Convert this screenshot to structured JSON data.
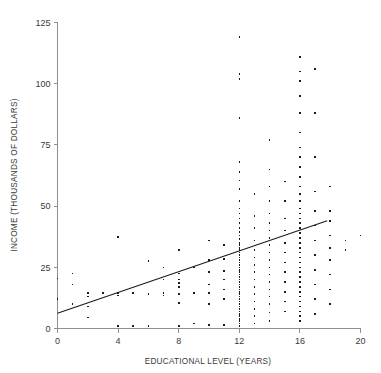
{
  "chart_data": {
    "type": "scatter",
    "title": "",
    "xlabel": "EDUCATIONAL LEVEL (YEARS)",
    "ylabel": "INCOME (THOUSANDS OF DOLLARS)",
    "xlim": [
      0,
      20
    ],
    "ylim": [
      0,
      125
    ],
    "xticks": [
      0,
      4,
      8,
      12,
      16,
      20
    ],
    "yticks": [
      0,
      25,
      50,
      75,
      100,
      125
    ],
    "xticklabels": [
      "0",
      "4",
      "8",
      "12",
      "16",
      "20"
    ],
    "yticklabels": [
      "0",
      "25",
      "50",
      "75",
      "100",
      "125"
    ],
    "grid": false,
    "legend": null,
    "marker": "square",
    "marker_color": "#1c1c1c",
    "marker_size_px": 1.6,
    "trendline": {
      "label": "least-squares regression line",
      "color": "#1a1a1a",
      "x_start": 0,
      "y_start": 6.2,
      "x_end": 17.8,
      "y_end": 44.0,
      "slope": 2.12,
      "intercept": 6.2
    },
    "points": [
      [
        0,
        20.5
      ],
      [
        0,
        12.0
      ],
      [
        1,
        22.5
      ],
      [
        1,
        18.0
      ],
      [
        1,
        10.0
      ],
      [
        2,
        14.5
      ],
      [
        2,
        9.0
      ],
      [
        2,
        4.5
      ],
      [
        2,
        13.0
      ],
      [
        3,
        14.5
      ],
      [
        4,
        37.5
      ],
      [
        4,
        14.5
      ],
      [
        4,
        13.5
      ],
      [
        4,
        1.0
      ],
      [
        5,
        14.5
      ],
      [
        5,
        1.0
      ],
      [
        6,
        27.5
      ],
      [
        6,
        14.0
      ],
      [
        6,
        1.0
      ],
      [
        7,
        25.0
      ],
      [
        7,
        20.0
      ],
      [
        7,
        14.5
      ],
      [
        7,
        13.5
      ],
      [
        8,
        32.0
      ],
      [
        8,
        22.5
      ],
      [
        8,
        20.0
      ],
      [
        8,
        18.5
      ],
      [
        8,
        17.0
      ],
      [
        8,
        14.0
      ],
      [
        8,
        10.5
      ],
      [
        8,
        1.0
      ],
      [
        9,
        25.0
      ],
      [
        9,
        14.5
      ],
      [
        9,
        2.0
      ],
      [
        10,
        36.0
      ],
      [
        10,
        28.0
      ],
      [
        10,
        23.0
      ],
      [
        10,
        18.0
      ],
      [
        10,
        14.5
      ],
      [
        10,
        10.0
      ],
      [
        10,
        1.5
      ],
      [
        11,
        34.0
      ],
      [
        11,
        28.5
      ],
      [
        11,
        23.5
      ],
      [
        11,
        20.0
      ],
      [
        11,
        16.0
      ],
      [
        11,
        12.0
      ],
      [
        11,
        1.5
      ],
      [
        12,
        119.0
      ],
      [
        12,
        104.0
      ],
      [
        12,
        102.0
      ],
      [
        12,
        86.0
      ],
      [
        12,
        68.0
      ],
      [
        12,
        64.0
      ],
      [
        12,
        60.5
      ],
      [
        12,
        57.0
      ],
      [
        12,
        52.0
      ],
      [
        12,
        49.0
      ],
      [
        12,
        47.0
      ],
      [
        12,
        45.0
      ],
      [
        12,
        43.0
      ],
      [
        12,
        41.0
      ],
      [
        12,
        39.5
      ],
      [
        12,
        38.0
      ],
      [
        12,
        36.5
      ],
      [
        12,
        35.0
      ],
      [
        12,
        34.0
      ],
      [
        12,
        33.0
      ],
      [
        12,
        32.0
      ],
      [
        12,
        31.0
      ],
      [
        12,
        30.0
      ],
      [
        12,
        29.0
      ],
      [
        12,
        28.0
      ],
      [
        12,
        27.0
      ],
      [
        12,
        26.0
      ],
      [
        12,
        25.0
      ],
      [
        12,
        24.0
      ],
      [
        12,
        23.0
      ],
      [
        12,
        22.0
      ],
      [
        12,
        21.0
      ],
      [
        12,
        20.0
      ],
      [
        12,
        19.0
      ],
      [
        12,
        18.0
      ],
      [
        12,
        17.0
      ],
      [
        12,
        16.0
      ],
      [
        12,
        15.0
      ],
      [
        12,
        14.0
      ],
      [
        12,
        13.0
      ],
      [
        12,
        12.0
      ],
      [
        12,
        11.0
      ],
      [
        12,
        10.0
      ],
      [
        12,
        9.0
      ],
      [
        12,
        8.0
      ],
      [
        12,
        7.0
      ],
      [
        12,
        6.0
      ],
      [
        12,
        5.0
      ],
      [
        12,
        4.0
      ],
      [
        12,
        3.0
      ],
      [
        12,
        2.0
      ],
      [
        12,
        1.0
      ],
      [
        13,
        55.0
      ],
      [
        13,
        46.0
      ],
      [
        13,
        41.0
      ],
      [
        13,
        36.0
      ],
      [
        13,
        32.0
      ],
      [
        13,
        29.0
      ],
      [
        13,
        26.0
      ],
      [
        13,
        23.0
      ],
      [
        13,
        20.0
      ],
      [
        13,
        17.0
      ],
      [
        13,
        14.0
      ],
      [
        13,
        11.0
      ],
      [
        13,
        8.0
      ],
      [
        13,
        5.0
      ],
      [
        13,
        2.0
      ],
      [
        14,
        77.0
      ],
      [
        14,
        65.0
      ],
      [
        14,
        58.0
      ],
      [
        14,
        52.0
      ],
      [
        14,
        47.0
      ],
      [
        14,
        43.0
      ],
      [
        14,
        40.0
      ],
      [
        14,
        37.0
      ],
      [
        14,
        34.0
      ],
      [
        14,
        31.0
      ],
      [
        14,
        28.0
      ],
      [
        14,
        25.0
      ],
      [
        14,
        22.0
      ],
      [
        14,
        19.0
      ],
      [
        14,
        16.0
      ],
      [
        14,
        13.0
      ],
      [
        14,
        10.0
      ],
      [
        14,
        6.5
      ],
      [
        14,
        3.0
      ],
      [
        15,
        60.0
      ],
      [
        15,
        52.0
      ],
      [
        15,
        45.0
      ],
      [
        15,
        40.0
      ],
      [
        15,
        35.0
      ],
      [
        15,
        31.0
      ],
      [
        15,
        27.0
      ],
      [
        15,
        23.0
      ],
      [
        15,
        19.0
      ],
      [
        15,
        15.0
      ],
      [
        15,
        11.0
      ],
      [
        15,
        7.0
      ],
      [
        16,
        111.0
      ],
      [
        16,
        105.0
      ],
      [
        16,
        101.0
      ],
      [
        16,
        95.0
      ],
      [
        16,
        88.0
      ],
      [
        16,
        80.0
      ],
      [
        16,
        74.0
      ],
      [
        16,
        70.0
      ],
      [
        16,
        66.0
      ],
      [
        16,
        62.0
      ],
      [
        16,
        58.0
      ],
      [
        16,
        55.0
      ],
      [
        16,
        52.0
      ],
      [
        16,
        49.0
      ],
      [
        16,
        47.0
      ],
      [
        16,
        45.0
      ],
      [
        16,
        43.0
      ],
      [
        16,
        41.0
      ],
      [
        16,
        39.0
      ],
      [
        16,
        37.0
      ],
      [
        16,
        35.0
      ],
      [
        16,
        33.0
      ],
      [
        16,
        31.0
      ],
      [
        16,
        29.0
      ],
      [
        16,
        27.0
      ],
      [
        16,
        25.0
      ],
      [
        16,
        23.0
      ],
      [
        16,
        21.0
      ],
      [
        16,
        19.0
      ],
      [
        16,
        17.0
      ],
      [
        16,
        15.0
      ],
      [
        16,
        13.0
      ],
      [
        16,
        11.0
      ],
      [
        16,
        9.0
      ],
      [
        16,
        7.0
      ],
      [
        16,
        5.0
      ],
      [
        16,
        3.0
      ],
      [
        17,
        106.0
      ],
      [
        17,
        88.0
      ],
      [
        17,
        70.0
      ],
      [
        17,
        56.0
      ],
      [
        17,
        48.0
      ],
      [
        17,
        42.0
      ],
      [
        17,
        36.0
      ],
      [
        17,
        30.0
      ],
      [
        17,
        24.0
      ],
      [
        17,
        18.0
      ],
      [
        17,
        12.0
      ],
      [
        17,
        6.0
      ],
      [
        18,
        58.0
      ],
      [
        18,
        48.0
      ],
      [
        18,
        44.0
      ],
      [
        18,
        38.0
      ],
      [
        18,
        33.0
      ],
      [
        18,
        28.0
      ],
      [
        18,
        22.0
      ],
      [
        18,
        16.0
      ],
      [
        18,
        10.0
      ],
      [
        19,
        36.0
      ],
      [
        19,
        32.0
      ],
      [
        20,
        38.0
      ]
    ]
  }
}
